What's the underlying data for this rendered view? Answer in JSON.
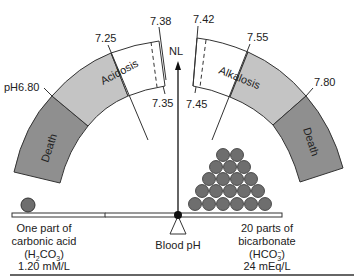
{
  "diagram": {
    "colors": {
      "death": "#8f8f8f",
      "disorder": "#c4c4c4",
      "normal": "#ffffff",
      "outline": "#333333",
      "sphere": "#6e6e6e",
      "beam": "#ffffff"
    },
    "scale": {
      "left": {
        "death_label": "Death",
        "disorder_label": "Acidosis",
        "ticks": [
          "pH6.80",
          "7.25",
          "7.38",
          "7.35"
        ]
      },
      "right": {
        "death_label": "Death",
        "disorder_label": "Alkalosis",
        "ticks": [
          "7.42",
          "7.55",
          "7.80",
          "7.45"
        ]
      },
      "normal_label": "NL"
    },
    "fulcrum_label": "Blood pH",
    "left_pan": {
      "line1": "One part of",
      "line2": "carbonic acid",
      "formula_pre": "(H",
      "formula_sub": "2",
      "formula_post": "CO",
      "formula_sub2": "3",
      "formula_end": ")",
      "concentration": "1.20 mM/L",
      "sphere_count": 1
    },
    "right_pan": {
      "line1": "20 parts of",
      "line2": "bicarbonate",
      "formula_pre": "(HCO",
      "formula_sub": "3",
      "formula_sup": "−",
      "formula_end": ")",
      "concentration": "24 mEq/L",
      "sphere_count": 20,
      "pyramid_rows": [
        2,
        3,
        4,
        5,
        6
      ]
    }
  }
}
